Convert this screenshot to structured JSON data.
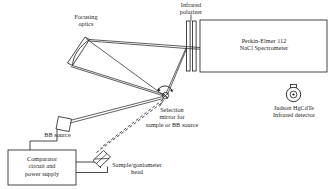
{
  "diagram": {
    "stroke_color": "#1a1a1a",
    "fill_color": "#ffffff",
    "labels": {
      "focusing_optics": "Focusing\noptics",
      "infrared_polarizer": "Infrared\npolarizer",
      "spectrometer": "Perkin-Elmer 112\nNaCl Spectrometer",
      "detector": "Judson HgCdTe\nInfrared detector",
      "selection_mirror": "Selection\nmirror for\nsample or BB source",
      "bb_source": "BB source",
      "comparator": "Comparator\ncircuit and\npower supply",
      "sample_goniometer": "Sample/goniometer\nhead"
    },
    "components": [
      {
        "name": "focusing-optics",
        "type": "curved-mirror"
      },
      {
        "name": "infrared-polarizer",
        "type": "двух-bar-plate"
      },
      {
        "name": "spectrometer-box",
        "type": "rectangle"
      },
      {
        "name": "infrared-detector",
        "type": "circular-detector"
      },
      {
        "name": "selection-mirror",
        "type": "rotating-mirror"
      },
      {
        "name": "bb-source-box",
        "type": "small-square"
      },
      {
        "name": "comparator-box",
        "type": "rectangle"
      },
      {
        "name": "sample-holder",
        "type": "tilted-plate"
      }
    ],
    "beam_paths": {
      "solid_count": 8,
      "dashed_count": 2,
      "description": "Solid lines are optical beam paths; dashed lines show the alternate sample beam path"
    }
  }
}
